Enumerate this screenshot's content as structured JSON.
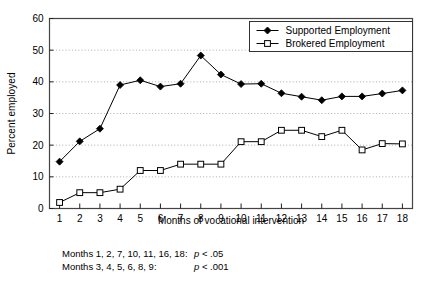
{
  "chart_data": {
    "type": "line",
    "title": "",
    "xlabel": "Months of vocational intervention",
    "ylabel": "Percent employed",
    "x": [
      1,
      2,
      3,
      4,
      5,
      6,
      7,
      8,
      9,
      10,
      11,
      12,
      13,
      14,
      15,
      16,
      17,
      18
    ],
    "xticklabels": [
      "1",
      "2",
      "3",
      "4",
      "5",
      "6",
      "7",
      "8",
      "9",
      "10",
      "11",
      "12",
      "13",
      "14",
      "15",
      "16",
      "17",
      "18"
    ],
    "yticklabels": [
      "0",
      "10",
      "20",
      "30",
      "40",
      "50",
      "60"
    ],
    "yticks": [
      0,
      10,
      20,
      30,
      40,
      50,
      60
    ],
    "xlim": [
      0.5,
      18.5
    ],
    "ylim": [
      0,
      60
    ],
    "grid": "horizontal-dotted",
    "legend_position": "top-right",
    "series": [
      {
        "name": "Supported Employment",
        "marker": "filled-diamond",
        "color": "#000000",
        "values": [
          14.8,
          21.2,
          25.2,
          39.0,
          40.5,
          38.5,
          39.4,
          48.3,
          42.3,
          39.3,
          39.4,
          36.4,
          35.3,
          34.2,
          35.4,
          35.4,
          36.3,
          37.3
        ]
      },
      {
        "name": "Brokered Employment",
        "marker": "open-square",
        "color": "#000000",
        "values": [
          1.9,
          5.0,
          5.0,
          6.1,
          12.0,
          12.0,
          14.0,
          14.0,
          14.0,
          21.1,
          21.1,
          24.7,
          24.7,
          22.7,
          24.7,
          18.5,
          20.5,
          20.4
        ]
      }
    ],
    "annotations": [
      {
        "months": "Months 1, 2, 7, 10, 11, 16, 18:",
        "p": "p",
        "pvalue": " < .05"
      },
      {
        "months": "Months 3, 4, 5, 6, 8, 9:",
        "p": "p",
        "pvalue": " < .001"
      }
    ]
  }
}
